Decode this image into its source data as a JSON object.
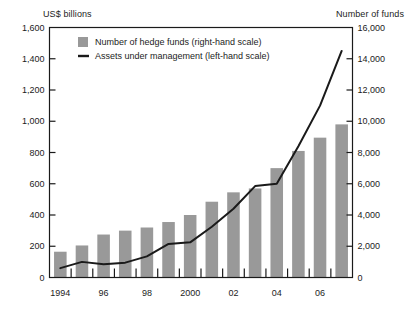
{
  "chart_data": {
    "type": "bar",
    "title": "",
    "subtitle": "",
    "xlabel": "",
    "ylabel": "US$ billions",
    "y2label": "Number of funds",
    "grid": false,
    "legend_position": "top-left-inside",
    "x": [
      1994,
      1995,
      1996,
      1997,
      1998,
      1999,
      2000,
      2001,
      2002,
      2003,
      2004,
      2005,
      2006,
      2007
    ],
    "categories": [
      "1994",
      "1995",
      "1996",
      "1997",
      "1998",
      "1999",
      "2000",
      "2001",
      "2002",
      "2003",
      "2004",
      "2005",
      "2006",
      "2007"
    ],
    "xtick_labels": [
      "1994",
      "",
      "96",
      "",
      "98",
      "",
      "2000",
      "",
      "02",
      "",
      "04",
      "",
      "06",
      ""
    ],
    "ylim": [
      0,
      1600
    ],
    "ytick_labels": [
      "0",
      "200",
      "400",
      "600",
      "800",
      "1,000",
      "1,200",
      "1,400",
      "1,600"
    ],
    "ytick_values": [
      0,
      200,
      400,
      600,
      800,
      1000,
      1200,
      1400,
      1600
    ],
    "y2lim": [
      0,
      16000
    ],
    "y2tick_labels": [
      "0",
      "2,000",
      "4,000",
      "6,000",
      "8,000",
      "10,000",
      "12,000",
      "14,000",
      "16,000"
    ],
    "y2tick_values": [
      0,
      2000,
      4000,
      6000,
      8000,
      10000,
      12000,
      14000,
      16000
    ],
    "series": [
      {
        "name": "Number of hedge funds (right-hand scale)",
        "type": "bar",
        "axis": "right",
        "color": "#999999",
        "values": [
          1650,
          2050,
          2750,
          3000,
          3200,
          3550,
          4000,
          4850,
          5450,
          5700,
          7000,
          8100,
          8950,
          9800
        ]
      },
      {
        "name": "Assets under management (left-hand scale)",
        "type": "line",
        "axis": "left",
        "color": "#1a1a1a",
        "values": [
          60,
          100,
          85,
          95,
          135,
          215,
          225,
          325,
          440,
          585,
          600,
          840,
          1100,
          1450
        ]
      }
    ],
    "legend": [
      {
        "label": "Number of hedge funds (right-hand scale)",
        "marker": "square",
        "color": "#999999"
      },
      {
        "label": "Assets under management (left-hand scale)",
        "marker": "line",
        "color": "#1a1a1a"
      }
    ]
  }
}
